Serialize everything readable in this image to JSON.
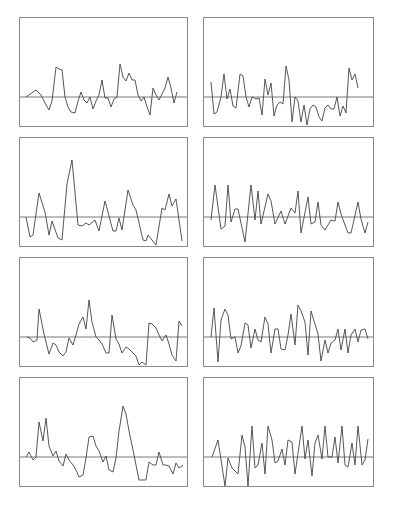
{
  "figure": {
    "layout": "4 rows x 2 columns of small line-plot panels, each with a horizontal zero reference line, no axis ticks or labels",
    "line_color": "#444444",
    "frame_color": "#8a8a8a",
    "baseline_color": "#555555"
  },
  "chart_data": [
    {
      "type": "line",
      "panel": "row1-left",
      "title": "",
      "xlabel": "",
      "ylabel": "",
      "grid": false,
      "baseline": 0,
      "x": [
        6,
        16,
        21,
        26,
        29,
        32,
        36,
        39,
        42,
        45,
        48,
        51,
        55,
        58,
        61,
        64,
        67,
        70,
        73,
        76,
        79,
        82,
        85,
        88,
        91,
        94,
        97,
        100,
        103,
        106,
        109,
        112,
        115,
        118,
        121,
        124,
        127,
        130,
        133,
        136,
        139,
        142,
        145,
        148,
        151,
        154,
        157
      ],
      "values": [
        0,
        7,
        2,
        -8,
        -13,
        -4,
        30,
        28,
        27,
        0,
        -10,
        -15,
        -16,
        -4,
        5,
        -3,
        -6,
        0,
        -12,
        -4,
        2,
        17,
        -1,
        -1,
        -10,
        -2,
        0,
        33,
        20,
        16,
        24,
        17,
        17,
        2,
        -4,
        0,
        -10,
        -18,
        9,
        2,
        -3,
        3,
        9,
        20,
        9,
        -6,
        5
      ]
    },
    {
      "type": "line",
      "panel": "row1-right",
      "title": "",
      "xlabel": "",
      "ylabel": "",
      "grid": false,
      "baseline": 0,
      "x": [
        7,
        10,
        13,
        17,
        20,
        23,
        26,
        29,
        32,
        36,
        39,
        42,
        45,
        48,
        52,
        55,
        58,
        61,
        64,
        67,
        70,
        73,
        76,
        79,
        82,
        85,
        88,
        91,
        94,
        97,
        100,
        103,
        106,
        109,
        112,
        115,
        118,
        121,
        124,
        127,
        130,
        133,
        136,
        139,
        142,
        145,
        148,
        151,
        154
      ],
      "values": [
        15,
        -17,
        -15,
        0,
        23,
        -2,
        8,
        -9,
        -11,
        23,
        21,
        0,
        -10,
        0,
        -2,
        -1,
        -18,
        18,
        2,
        14,
        -19,
        -8,
        -5,
        -7,
        31,
        17,
        -25,
        0,
        -4,
        -25,
        -8,
        -28,
        -12,
        -8,
        -10,
        -20,
        -24,
        -11,
        -8,
        -12,
        -12,
        0,
        -19,
        -9,
        -16,
        29,
        17,
        23,
        9
      ]
    },
    {
      "type": "line",
      "panel": "row2-left",
      "title": "",
      "xlabel": "",
      "ylabel": "",
      "grid": false,
      "baseline": 0,
      "x": [
        6,
        10,
        13,
        19,
        25,
        29,
        32,
        38,
        42,
        47,
        52,
        58,
        62,
        66,
        69,
        75,
        79,
        85,
        93,
        96,
        99,
        102,
        108,
        113,
        116,
        123,
        126,
        128,
        136,
        142,
        145,
        149,
        152,
        156,
        162
      ],
      "values": [
        0,
        -20,
        -18,
        24,
        5,
        -18,
        -4,
        -21,
        -23,
        33,
        57,
        -8,
        -9,
        -6,
        -8,
        -3,
        -14,
        16,
        -14,
        -14,
        -1,
        -13,
        27,
        12,
        7,
        -23,
        -24,
        -18,
        -28,
        9,
        7,
        23,
        11,
        18,
        -24
      ]
    },
    {
      "type": "line",
      "panel": "row2-right",
      "title": "",
      "xlabel": "",
      "ylabel": "",
      "grid": false,
      "baseline": 0,
      "x": [
        7,
        11,
        17,
        21,
        24,
        27,
        31,
        34,
        41,
        47,
        51,
        54,
        57,
        64,
        67,
        71,
        77,
        81,
        87,
        91,
        94,
        97,
        104,
        107,
        111,
        114,
        117,
        121,
        127,
        131,
        134,
        137,
        144,
        147,
        154,
        157,
        161,
        164
      ],
      "values": [
        -3,
        32,
        -12,
        -9,
        32,
        -5,
        8,
        8,
        -25,
        32,
        -3,
        26,
        -7,
        23,
        16,
        -7,
        6,
        -7,
        9,
        4,
        26,
        -16,
        20,
        -7,
        -5,
        15,
        -8,
        -13,
        -3,
        -4,
        15,
        3,
        -16,
        -16,
        15,
        -2,
        -16,
        -5
      ]
    },
    {
      "type": "line",
      "panel": "row3-left",
      "title": "",
      "xlabel": "",
      "ylabel": "",
      "grid": false,
      "baseline": 0,
      "x": [
        7,
        10,
        13,
        17,
        19,
        24,
        29,
        33,
        36,
        39,
        43,
        46,
        49,
        53,
        56,
        59,
        63,
        66,
        69,
        72,
        76,
        79,
        82,
        86,
        89,
        92,
        96,
        99,
        102,
        106,
        109,
        112,
        116,
        119,
        122,
        126,
        129,
        132,
        136,
        139,
        142,
        146,
        149,
        152,
        156,
        159,
        162
      ],
      "values": [
        0,
        -1,
        -5,
        -3,
        28,
        3,
        -17,
        -6,
        -8,
        -15,
        -19,
        -15,
        -1,
        -8,
        2,
        13,
        20,
        8,
        37,
        15,
        0,
        -3,
        -7,
        -16,
        -16,
        22,
        -2,
        -7,
        -16,
        -10,
        -12,
        -15,
        -19,
        -28,
        -25,
        -28,
        14,
        13,
        9,
        2,
        -4,
        2,
        -7,
        -18,
        -24,
        16,
        11
      ]
    },
    {
      "type": "line",
      "panel": "row3-right",
      "title": "",
      "xlabel": "",
      "ylabel": "",
      "grid": false,
      "baseline": 0,
      "x": [
        7,
        10,
        14,
        17,
        21,
        24,
        27,
        31,
        34,
        37,
        41,
        44,
        47,
        51,
        54,
        57,
        61,
        64,
        67,
        71,
        74,
        77,
        81,
        84,
        87,
        91,
        94,
        97,
        101,
        104,
        107,
        111,
        114,
        117,
        121,
        124,
        127,
        131,
        134,
        137,
        141,
        144,
        147,
        151,
        154,
        157,
        161,
        164
      ],
      "values": [
        0,
        29,
        -25,
        17,
        28,
        22,
        -2,
        0,
        -16,
        -9,
        14,
        12,
        -11,
        8,
        -3,
        -5,
        20,
        13,
        -16,
        8,
        8,
        -12,
        -13,
        2,
        23,
        -8,
        32,
        26,
        15,
        -18,
        26,
        13,
        3,
        -24,
        -3,
        -16,
        -6,
        -3,
        8,
        -13,
        8,
        -16,
        2,
        8,
        -5,
        7,
        8,
        -2
      ]
    },
    {
      "type": "line",
      "panel": "row4-left",
      "title": "",
      "xlabel": "",
      "ylabel": "",
      "grid": false,
      "baseline": 0,
      "x": [
        6,
        9,
        13,
        16,
        19,
        23,
        26,
        29,
        33,
        36,
        39,
        43,
        46,
        49,
        53,
        56,
        59,
        63,
        66,
        69,
        73,
        76,
        79,
        83,
        86,
        89,
        93,
        96,
        99,
        103,
        106,
        109,
        113,
        116,
        119,
        123,
        126,
        129,
        133,
        136,
        139,
        143,
        146,
        149,
        153,
        156,
        159,
        163
      ],
      "values": [
        0,
        5,
        -3,
        0,
        35,
        16,
        39,
        11,
        1,
        6,
        -4,
        -9,
        3,
        -3,
        -8,
        -13,
        -20,
        -18,
        -1,
        20,
        21,
        11,
        6,
        -5,
        1,
        -13,
        -15,
        -1,
        26,
        51,
        43,
        26,
        7,
        -8,
        -23,
        -23,
        -23,
        -5,
        -8,
        -8,
        5,
        -8,
        -8,
        -9,
        -17,
        -6,
        -11,
        -8
      ]
    },
    {
      "type": "line",
      "panel": "row4-right",
      "title": "",
      "xlabel": "",
      "ylabel": "",
      "grid": false,
      "baseline": 0,
      "x": [
        8,
        14,
        21,
        24,
        28,
        34,
        38,
        41,
        44,
        48,
        51,
        54,
        58,
        61,
        64,
        68,
        71,
        74,
        78,
        81,
        84,
        88,
        91,
        98,
        101,
        104,
        108,
        111,
        114,
        118,
        121,
        124,
        128,
        131,
        134,
        138,
        141,
        144,
        148,
        151,
        154,
        158,
        161,
        164
      ],
      "values": [
        0,
        17,
        -29,
        -1,
        -11,
        -17,
        22,
        10,
        -29,
        31,
        -11,
        -8,
        14,
        -17,
        31,
        17,
        -6,
        -4,
        8,
        -8,
        17,
        15,
        -17,
        31,
        -2,
        17,
        -19,
        14,
        22,
        -2,
        31,
        0,
        0,
        20,
        -6,
        31,
        -8,
        -10,
        14,
        -8,
        31,
        -8,
        -3,
        18
      ]
    }
  ]
}
